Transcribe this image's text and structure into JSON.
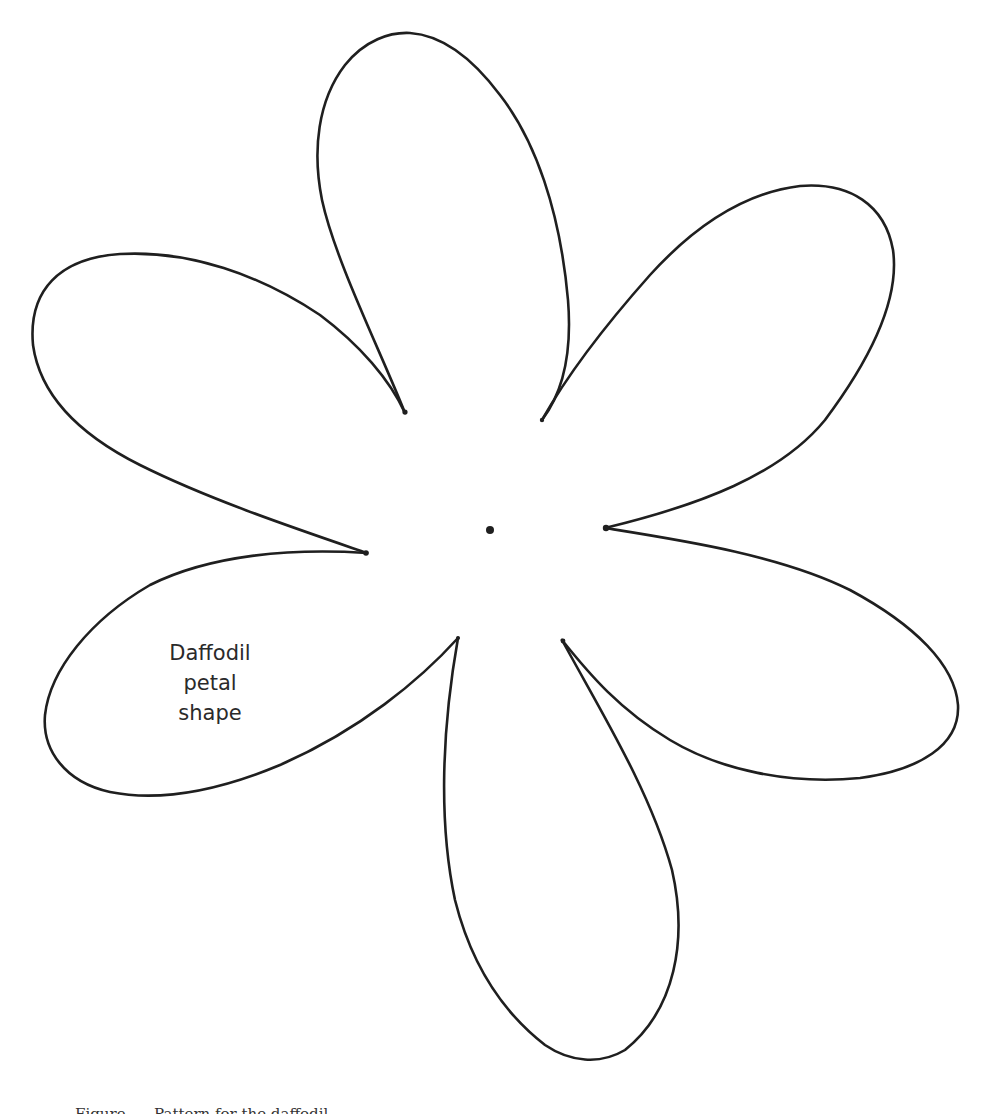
{
  "diagram": {
    "label": {
      "lines": [
        "Daffodil",
        "petal",
        "shape"
      ]
    },
    "caption": "Figure      Pattern for the daffodil",
    "colors": {
      "stroke": "#1f1f1f",
      "background": "#ffffff",
      "label_text": "#2a2a2a"
    },
    "center_dot": {
      "x": 490,
      "y": 530,
      "r": 4
    },
    "petals": [
      {
        "name": "top",
        "tips": [
          [
            405,
            413
          ],
          [
            542,
            420
          ]
        ]
      },
      {
        "name": "upper-right",
        "tips": [
          [
            542,
            420
          ],
          [
            605,
            528
          ]
        ]
      },
      {
        "name": "right",
        "tips": [
          [
            605,
            528
          ],
          [
            562,
            640
          ]
        ]
      },
      {
        "name": "bottom",
        "tips": [
          [
            562,
            640
          ],
          [
            458,
            638
          ]
        ]
      },
      {
        "name": "lower-left",
        "tips": [
          [
            458,
            638
          ],
          [
            367,
            553
          ]
        ]
      },
      {
        "name": "upper-left",
        "tips": [
          [
            367,
            553
          ],
          [
            405,
            413
          ]
        ]
      }
    ],
    "petal_count": 6
  }
}
